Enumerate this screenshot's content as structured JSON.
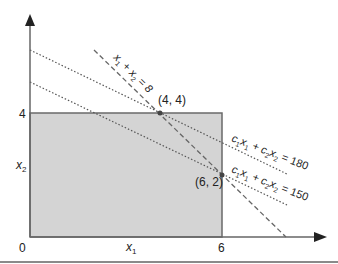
{
  "figure": {
    "axes": {
      "x_label": "x",
      "x_label_sub": "1",
      "y_label": "x",
      "y_label_sub": "2",
      "origin_label": "0",
      "x_tick_label": "6",
      "y_tick_label": "4"
    },
    "constraint_line": {
      "label_parts": [
        "x",
        "1",
        " + x",
        "2",
        " = 8"
      ]
    },
    "iso_lines": [
      {
        "label_parts": [
          "c",
          "1",
          "x",
          "1",
          " + c",
          "2",
          "x",
          "2",
          " = 180"
        ]
      },
      {
        "label_parts": [
          "c",
          "1",
          "x",
          "1",
          " + c",
          "2",
          "x",
          "2",
          " = 150"
        ]
      }
    ],
    "points": [
      {
        "label": "(4, 4)"
      },
      {
        "label": "(6, 2)"
      }
    ],
    "colors": {
      "feasible_region": "#d4d4d4",
      "axis": "#555555",
      "lines": "#666666",
      "footer_line": "#8a8a8a"
    }
  }
}
